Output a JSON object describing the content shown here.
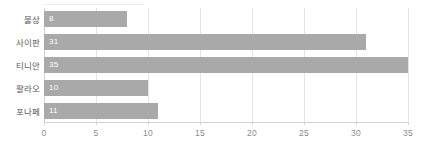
{
  "chart_data": {
    "type": "bar",
    "orientation": "horizontal",
    "title": "",
    "subtitle": "",
    "xlabel": "",
    "ylabel": "",
    "categories": [
      "불상",
      "사이판",
      "티니안",
      "팔라오",
      "포나페"
    ],
    "values": [
      8,
      31,
      35,
      10,
      11
    ],
    "value_labels": [
      "8",
      "31",
      "35",
      "10",
      "11"
    ],
    "xlim": [
      0,
      35
    ],
    "xticks": [
      0,
      5,
      10,
      15,
      20,
      25,
      30,
      35
    ],
    "xtick_labels": [
      "0",
      "5",
      "10",
      "15",
      "20",
      "25",
      "30",
      "35"
    ],
    "grid": true,
    "grid_axis": "x",
    "legend": false,
    "legend_position": "none",
    "bar_color": "#a9a9a9",
    "value_label_color": "#ffffff",
    "axis_color": "#d2d2d2",
    "gridline_color": "#e4e4e4",
    "category_label_color": "#595959",
    "tick_label_color": "#8c8c8c",
    "background_color": "#ffffff"
  }
}
